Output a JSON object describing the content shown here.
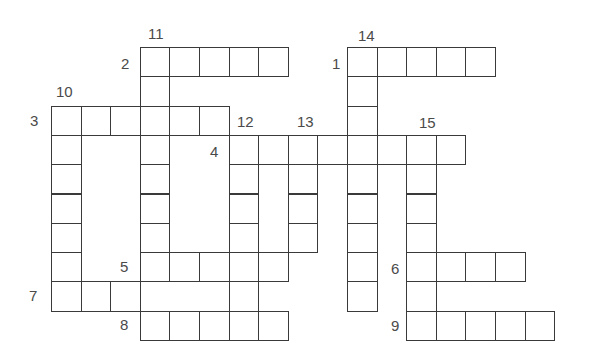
{
  "puzzle": {
    "type": "crossword",
    "grid": {
      "origin_x": 51,
      "origin_y": 47,
      "cell_w": 29.6,
      "cell_h": 29.3
    },
    "colors": {
      "line": "#3a3a3a",
      "number": "#4a4a4a",
      "background": "#ffffff"
    },
    "clues": [
      {
        "number": "1",
        "direction": "across",
        "row": 0,
        "col": 10,
        "length": 5,
        "label_x": 332,
        "label_y": 56
      },
      {
        "number": "2",
        "direction": "across",
        "row": 0,
        "col": 3,
        "length": 5,
        "label_x": 121,
        "label_y": 56
      },
      {
        "number": "3",
        "direction": "across",
        "row": 2,
        "col": 0,
        "length": 6,
        "label_x": 30,
        "label_y": 113
      },
      {
        "number": "4",
        "direction": "across",
        "row": 3,
        "col": 6,
        "length": 8,
        "label_x": 210,
        "label_y": 144
      },
      {
        "number": "5",
        "direction": "across",
        "row": 7,
        "col": 3,
        "length": 5,
        "label_x": 120,
        "label_y": 259
      },
      {
        "number": "6",
        "direction": "across",
        "row": 7,
        "col": 12,
        "length": 4,
        "label_x": 391,
        "label_y": 261
      },
      {
        "number": "7",
        "direction": "across",
        "row": 8,
        "col": 0,
        "length": 3,
        "label_x": 29,
        "label_y": 288
      },
      {
        "number": "8",
        "direction": "across",
        "row": 9,
        "col": 3,
        "length": 5,
        "label_x": 120,
        "label_y": 317
      },
      {
        "number": "9",
        "direction": "across",
        "row": 9,
        "col": 12,
        "length": 5,
        "label_x": 391,
        "label_y": 318
      },
      {
        "number": "10",
        "direction": "down",
        "row": 2,
        "col": 0,
        "length": 7,
        "label_x": 56,
        "label_y": 84
      },
      {
        "number": "11",
        "direction": "down",
        "row": 0,
        "col": 3,
        "length": 8,
        "label_x": 148,
        "label_y": 26
      },
      {
        "number": "12",
        "direction": "down",
        "row": 3,
        "col": 6,
        "length": 7,
        "label_x": 237,
        "label_y": 114
      },
      {
        "number": "13",
        "direction": "down",
        "row": 3,
        "col": 8,
        "length": 4,
        "label_x": 297,
        "label_y": 114
      },
      {
        "number": "14",
        "direction": "down",
        "row": 0,
        "col": 10,
        "length": 9,
        "label_x": 358,
        "label_y": 28
      },
      {
        "number": "15",
        "direction": "down",
        "row": 3,
        "col": 12,
        "length": 7,
        "label_x": 419,
        "label_y": 115
      }
    ]
  }
}
